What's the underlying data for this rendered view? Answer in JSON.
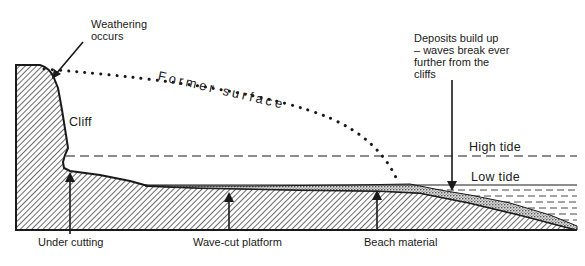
{
  "diagram": {
    "type": "coastal-erosion-cross-section",
    "labels": {
      "weathering": [
        "Weathering",
        "occurs"
      ],
      "former_surface": "Former surface",
      "cliff": "Cliff",
      "deposits": [
        "Deposits build up",
        "– waves break ever",
        "further from the",
        "cliffs"
      ],
      "high_tide": "High tide",
      "low_tide": "Low tide",
      "under_cutting": "Under cutting",
      "wave_cut_platform": "Wave-cut platform",
      "beach_material": "Beach material"
    },
    "colors": {
      "ink": "#1a1a1a",
      "background": "#ffffff"
    }
  }
}
